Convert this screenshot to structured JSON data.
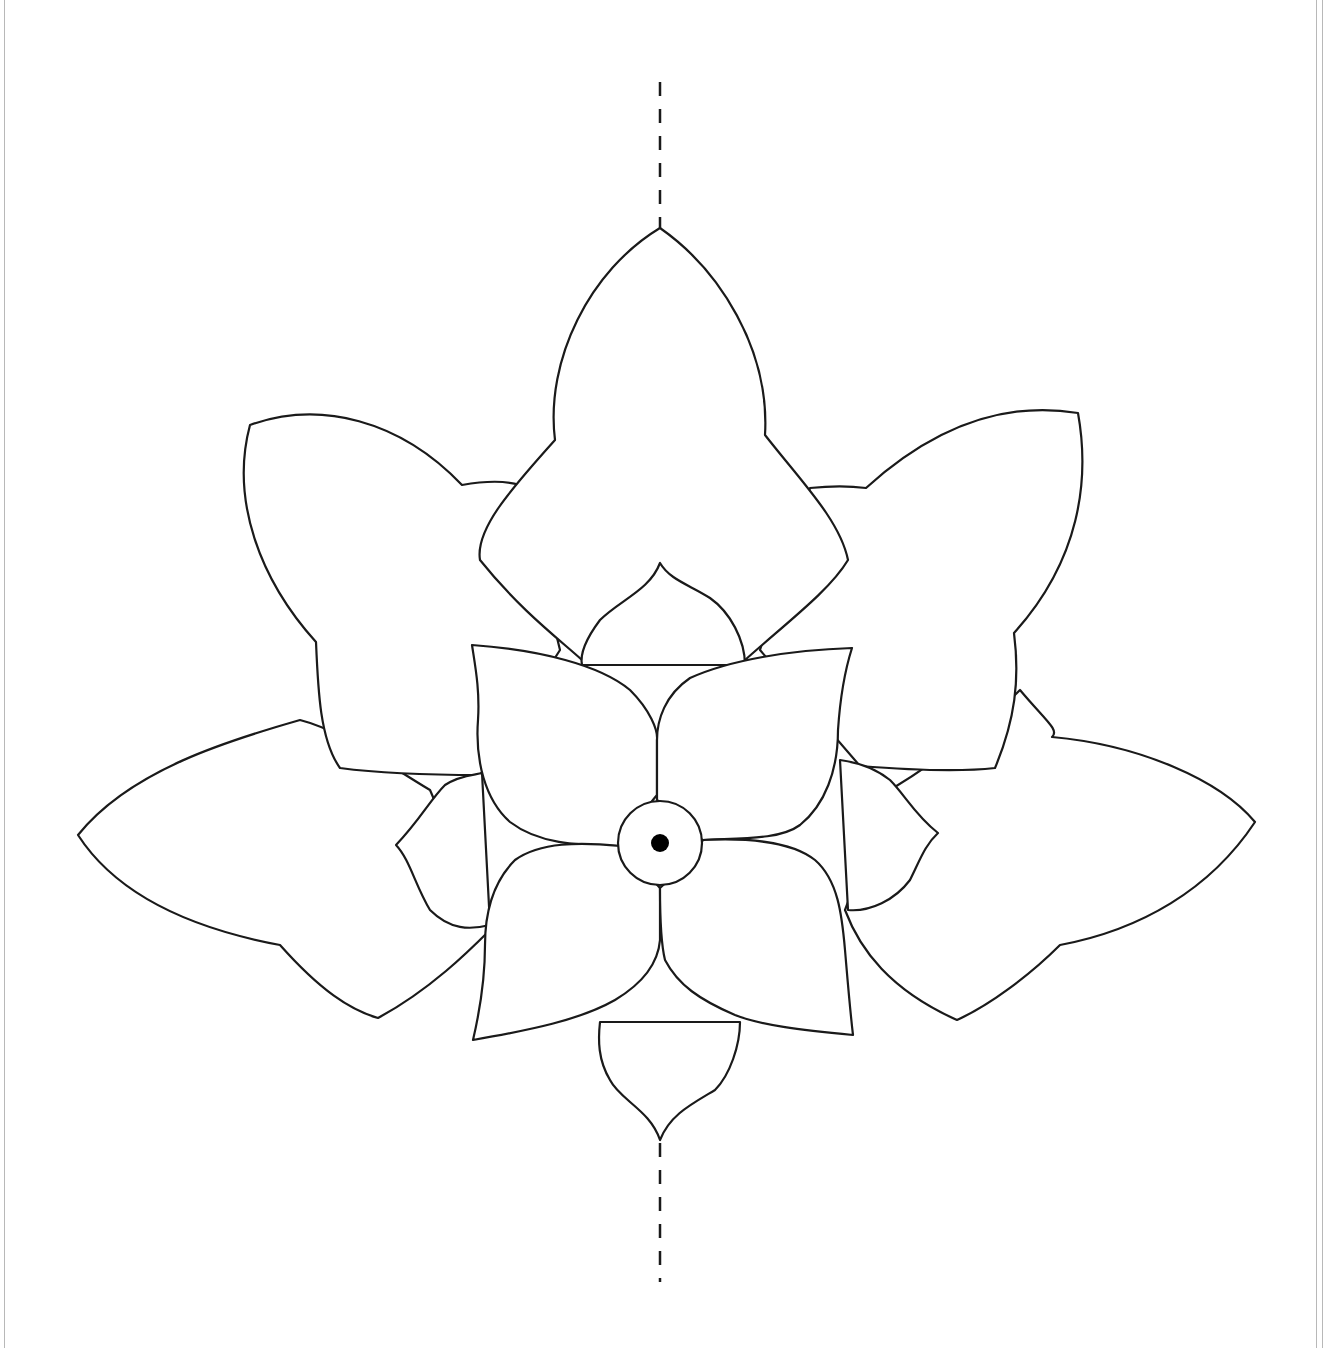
{
  "pattern": {
    "title": "",
    "description": "Flower petal template outline",
    "layers": [
      {
        "name": "outer-petals",
        "count": 5
      },
      {
        "name": "middle-petals",
        "count": 4
      },
      {
        "name": "inner-petals",
        "count": 4
      },
      {
        "name": "center-circle",
        "count": 1
      }
    ],
    "fold_line": "dashed vertical center line",
    "colors": {
      "line": "#1a1a1a",
      "background": "#ffffff",
      "border": "#b8b8b8"
    }
  }
}
